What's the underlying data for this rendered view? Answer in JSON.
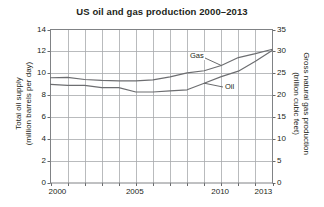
{
  "chart_data": {
    "type": "line",
    "title": "US oil and gas production 2000–2013",
    "xlabel": "",
    "ylabel": "Total oil supply\n(million barrels per day)",
    "y2label": "Gross natural gas production\n(trillion cubic feet)",
    "grid": true,
    "legend_position": "inline-annotation",
    "xlim": [
      2000,
      2013
    ],
    "ylim": [
      0,
      14
    ],
    "y2lim": [
      0,
      35
    ],
    "x": [
      2000,
      2001,
      2002,
      2003,
      2004,
      2005,
      2006,
      2007,
      2008,
      2009,
      2010,
      2011,
      2012,
      2013
    ],
    "xticks": [
      2000,
      2001,
      2002,
      2003,
      2004,
      2005,
      2006,
      2007,
      2008,
      2009,
      2010,
      2011,
      2012,
      2013
    ],
    "xtick_labels_shown": [
      "2000",
      "2005",
      "2010",
      "2013"
    ],
    "yticks": [
      0,
      2,
      4,
      6,
      8,
      10,
      12,
      14
    ],
    "y2ticks": [
      0,
      5,
      10,
      15,
      20,
      25,
      30,
      35
    ],
    "series": [
      {
        "name": "Gas",
        "axis": "right",
        "units": "trillion cubic feet",
        "values": [
          24.0,
          24.1,
          23.6,
          23.4,
          23.3,
          23.3,
          23.5,
          24.2,
          25.1,
          25.6,
          26.8,
          28.6,
          29.5,
          30.5
        ],
        "values_left_axis_equivalent": [
          9.6,
          9.65,
          9.45,
          9.35,
          9.3,
          9.3,
          9.4,
          9.7,
          10.05,
          10.25,
          10.7,
          11.45,
          11.8,
          12.2
        ]
      },
      {
        "name": "Oil",
        "axis": "left",
        "units": "million barrels per day",
        "values": [
          9.0,
          8.9,
          8.9,
          8.7,
          8.7,
          8.3,
          8.3,
          8.4,
          8.5,
          9.1,
          9.7,
          10.2,
          11.1,
          12.1
        ]
      }
    ],
    "annotations": [
      {
        "text": "Gas",
        "series": "Gas",
        "points_to_year": 2010
      },
      {
        "text": "Oil",
        "series": "Oil",
        "points_to_year": 2009
      }
    ]
  },
  "axes": {
    "left": {
      "title_line1": "Total oil supply",
      "title_line2": "(million barrels per day)",
      "ticks": [
        "14",
        "12",
        "10",
        "8",
        "6",
        "4",
        "2",
        "0"
      ]
    },
    "right": {
      "title_line1": "Gross natural gas production",
      "title_line2": "(trillion cubic feet)",
      "ticks": [
        "35",
        "30",
        "25",
        "20",
        "15",
        "10",
        "5",
        "0"
      ]
    },
    "bottom": {
      "ticks": [
        "2000",
        "2005",
        "2010",
        "2013"
      ]
    }
  },
  "labels": {
    "gas": "Gas",
    "oil": "Oil"
  },
  "caption": "",
  "colors": {
    "line": "#6d6e71",
    "grid": "#a7a9ac",
    "axis": "#58595b",
    "text": "#231f20",
    "background": "#ffffff"
  }
}
